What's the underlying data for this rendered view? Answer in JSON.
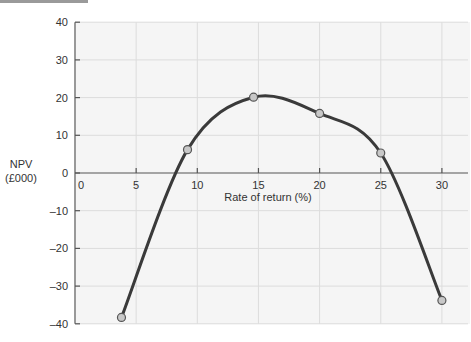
{
  "chart_data": {
    "type": "line",
    "title": "",
    "xlabel": "Rate of return (%)",
    "ylabel": "NPV (£000)",
    "ylabel_lines": [
      "NPV",
      "(£000)"
    ],
    "xlim": [
      0,
      30
    ],
    "ylim": [
      -40,
      40
    ],
    "x_ticks": [
      0,
      5,
      10,
      15,
      20,
      25,
      30
    ],
    "y_ticks": [
      40,
      30,
      20,
      10,
      0,
      -10,
      -20,
      -30,
      -40
    ],
    "y_tick_labels": [
      "40",
      "30",
      "20",
      "10",
      "0",
      "–10",
      "–20",
      "–30",
      "–40"
    ],
    "x_tick_labels": [
      "0",
      "5",
      "10",
      "15",
      "20",
      "25",
      "30"
    ],
    "grid": true,
    "legend": null,
    "series": [
      {
        "name": "NPV",
        "color": "#3a3a3a",
        "x": [
          3.8,
          9.2,
          14.6,
          20,
          25,
          30
        ],
        "y": [
          -38.3,
          6.2,
          20.1,
          15.8,
          5.3,
          -33.8
        ]
      }
    ]
  }
}
